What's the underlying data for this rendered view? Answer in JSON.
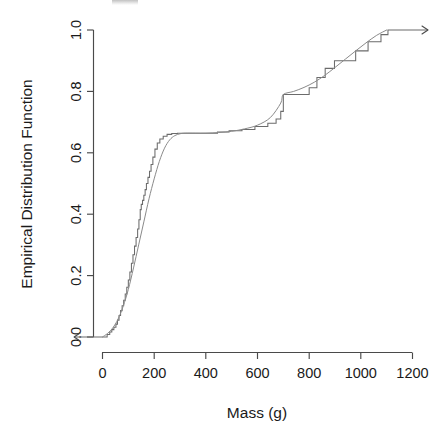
{
  "chart_data": {
    "type": "line",
    "title": "",
    "xlabel": "Mass (g)",
    "ylabel": "Empirical Distribution Function",
    "xlim": [
      -110,
      1260
    ],
    "ylim": [
      0.0,
      1.0
    ],
    "xticks": [
      0,
      200,
      400,
      600,
      800,
      1000,
      1200
    ],
    "xticklabels": [
      "0",
      "200",
      "400",
      "600",
      "800",
      "1000",
      "1200"
    ],
    "yticks": [
      0.0,
      0.2,
      0.4,
      0.6,
      0.8,
      1.0
    ],
    "yticklabels": [
      "0.0",
      "0.2",
      "0.4",
      "0.6",
      "0.8",
      "1.0"
    ],
    "grid": false,
    "legend": null,
    "series": [
      {
        "name": "Empirical distribution function (step)",
        "style": "step-post",
        "color": "#6b6b6b",
        "x": [
          -110,
          5,
          18,
          28,
          36,
          44,
          52,
          58,
          64,
          70,
          76,
          82,
          88,
          94,
          100,
          106,
          112,
          118,
          124,
          130,
          136,
          141,
          146,
          150,
          155,
          160,
          165,
          170,
          176,
          182,
          188,
          195,
          203,
          212,
          222,
          235,
          250,
          268,
          290,
          318,
          355,
          400,
          445,
          490,
          540,
          590,
          640,
          672,
          690,
          700,
          712,
          728,
          748,
          772,
          800,
          830,
          862,
          898,
          938,
          980,
          1028,
          1078,
          1105,
          1260
        ],
        "y": [
          0.0,
          0.0,
          0.008,
          0.016,
          0.024,
          0.032,
          0.042,
          0.055,
          0.07,
          0.086,
          0.102,
          0.12,
          0.14,
          0.162,
          0.186,
          0.212,
          0.24,
          0.268,
          0.296,
          0.324,
          0.352,
          0.382,
          0.415,
          0.432,
          0.445,
          0.462,
          0.48,
          0.5,
          0.52,
          0.54,
          0.562,
          0.586,
          0.612,
          0.632,
          0.645,
          0.654,
          0.66,
          0.663,
          0.664,
          0.664,
          0.664,
          0.664,
          0.668,
          0.672,
          0.676,
          0.686,
          0.696,
          0.71,
          0.735,
          0.79,
          0.79,
          0.79,
          0.79,
          0.79,
          0.812,
          0.845,
          0.875,
          0.9,
          0.9,
          0.932,
          0.962,
          0.985,
          1.0,
          1.0
        ]
      },
      {
        "name": "Smooth fitted distribution",
        "style": "smooth",
        "color": "#8a8a8a",
        "x": [
          0,
          20,
          40,
          60,
          80,
          100,
          120,
          140,
          160,
          180,
          200,
          220,
          240,
          260,
          280,
          300,
          320,
          360,
          400,
          450,
          500,
          550,
          600,
          650,
          690,
          700,
          740,
          780,
          820,
          860,
          900,
          940,
          980,
          1020,
          1060,
          1100
        ],
        "y": [
          0.0,
          0.012,
          0.03,
          0.058,
          0.1,
          0.155,
          0.225,
          0.3,
          0.375,
          0.45,
          0.515,
          0.572,
          0.615,
          0.642,
          0.656,
          0.662,
          0.664,
          0.664,
          0.664,
          0.666,
          0.67,
          0.678,
          0.69,
          0.715,
          0.762,
          0.79,
          0.8,
          0.813,
          0.83,
          0.852,
          0.878,
          0.905,
          0.932,
          0.958,
          0.982,
          1.0
        ]
      }
    ],
    "annotations": [
      {
        "name": "left-arrow",
        "at_x": -110,
        "at_y": 0.0,
        "direction": "left"
      },
      {
        "name": "right-arrow",
        "at_x": 1260,
        "at_y": 1.0,
        "direction": "right"
      }
    ],
    "plateau_value": 0.664,
    "plateau_x_range": [
      300,
      400
    ],
    "jump_at_700": 0.79
  },
  "axes": {
    "x_title": "Mass (g)",
    "y_title": "Empirical Distribution Function"
  }
}
